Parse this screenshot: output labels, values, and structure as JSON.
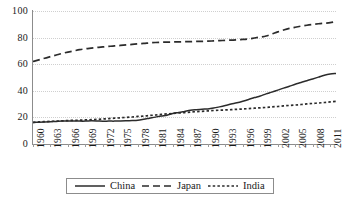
{
  "chart_data": {
    "type": "line",
    "title": "",
    "xlabel": "",
    "ylabel": "",
    "ylim": [
      0,
      100
    ],
    "yticks": [
      0,
      20,
      40,
      60,
      80,
      100
    ],
    "grid": true,
    "legend_position": "bottom",
    "x": [
      1960,
      1961,
      1962,
      1963,
      1964,
      1965,
      1966,
      1967,
      1968,
      1969,
      1970,
      1971,
      1972,
      1973,
      1974,
      1975,
      1976,
      1977,
      1978,
      1979,
      1980,
      1981,
      1982,
      1983,
      1984,
      1985,
      1986,
      1987,
      1988,
      1989,
      1990,
      1991,
      1992,
      1993,
      1994,
      1995,
      1996,
      1997,
      1998,
      1999,
      2000,
      2001,
      2002,
      2003,
      2004,
      2005,
      2006,
      2007,
      2008,
      2009,
      2010,
      2011,
      2012
    ],
    "tick_labels": [
      "1960",
      "1963",
      "1966",
      "1969",
      "1972",
      "1975",
      "1978",
      "1981",
      "1984",
      "1987",
      "1990",
      "1993",
      "1996",
      "1999",
      "2002",
      "2005",
      "2008",
      "2011"
    ],
    "series": [
      {
        "name": "China",
        "style": "solid",
        "values": [
          16.2,
          16.4,
          16.6,
          16.8,
          17.0,
          17.2,
          17.3,
          17.3,
          17.2,
          17.2,
          17.4,
          17.3,
          17.1,
          17.2,
          17.2,
          17.3,
          17.4,
          17.6,
          17.9,
          18.6,
          19.4,
          20.2,
          21.1,
          21.6,
          23.0,
          23.7,
          24.5,
          25.3,
          25.8,
          26.2,
          26.4,
          27.0,
          27.9,
          28.9,
          30.0,
          31.0,
          32.2,
          33.5,
          34.9,
          36.1,
          37.7,
          39.0,
          40.5,
          42.0,
          43.4,
          44.9,
          46.2,
          47.6,
          48.9,
          50.3,
          51.7,
          52.6,
          53.0
        ]
      },
      {
        "name": "Japan",
        "style": "long-dash",
        "values": [
          62.0,
          63.2,
          64.5,
          65.7,
          66.9,
          68.1,
          69.1,
          70.0,
          70.9,
          71.6,
          72.1,
          72.6,
          73.0,
          73.4,
          73.8,
          74.1,
          74.5,
          74.9,
          75.3,
          75.6,
          76.0,
          76.3,
          76.5,
          76.6,
          76.7,
          76.8,
          76.9,
          77.0,
          77.1,
          77.2,
          77.3,
          77.5,
          77.7,
          77.9,
          78.1,
          78.3,
          78.6,
          79.0,
          79.7,
          80.4,
          81.2,
          82.7,
          84.3,
          85.7,
          86.9,
          87.8,
          88.6,
          89.3,
          89.9,
          90.4,
          90.8,
          91.2,
          92.0
        ]
      },
      {
        "name": "India",
        "style": "short-dash",
        "values": [
          16.3,
          16.6,
          16.8,
          17.0,
          17.2,
          17.4,
          17.6,
          17.8,
          17.9,
          18.1,
          18.3,
          18.5,
          18.8,
          19.1,
          19.4,
          19.7,
          20.0,
          20.3,
          20.7,
          21.0,
          21.4,
          21.8,
          22.2,
          22.6,
          22.9,
          23.3,
          23.6,
          24.0,
          24.3,
          24.6,
          24.9,
          25.2,
          25.4,
          25.6,
          25.8,
          26.1,
          26.3,
          26.6,
          26.9,
          27.2,
          27.5,
          27.9,
          28.2,
          28.6,
          29.0,
          29.3,
          29.7,
          30.1,
          30.5,
          30.8,
          31.2,
          31.6,
          32.0
        ]
      }
    ]
  }
}
